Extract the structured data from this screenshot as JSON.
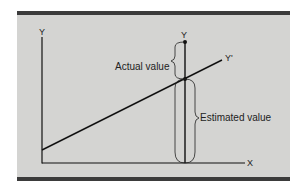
{
  "figure": {
    "background_color": "#d4d4d2",
    "frame_bar_color": "#3b3b3b",
    "line_color": "#111111"
  },
  "labels": {
    "y_axis": "Y",
    "x_axis": "X",
    "actual_point": "Y",
    "regression_line": "Y'",
    "actual_value": "Actual value",
    "estimated_value": "Estimated value"
  },
  "diagram": {
    "axes": {
      "origin": [
        42,
        163
      ],
      "y_top": 37,
      "x_right": 245
    },
    "regression_line": {
      "from": [
        42,
        150
      ],
      "to": [
        222,
        60
      ]
    },
    "observation": {
      "x": 185,
      "actual_y": 42,
      "estimated_y": 79
    },
    "braces": [
      {
        "name": "actual-value-brace",
        "from_y": 42,
        "to_y": 79,
        "side": "left"
      },
      {
        "name": "estimated-value-brace",
        "from_y": 79,
        "to_y": 163,
        "side": "right"
      }
    ]
  }
}
